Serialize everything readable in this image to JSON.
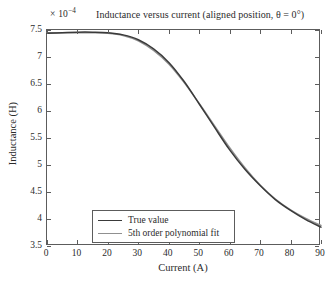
{
  "chart_data": {
    "type": "line",
    "title": "Inductance versus current (aligned position, θ = 0°)",
    "exponent_multiplier": "× 10",
    "exponent_power": "−4",
    "xlabel": "Current (A)",
    "ylabel": "Inductance (H)",
    "xlim": [
      0,
      90
    ],
    "ylim": [
      3.5,
      7.5
    ],
    "xticks": [
      0,
      10,
      20,
      30,
      40,
      50,
      60,
      70,
      80,
      90
    ],
    "yticks": [
      3.5,
      4,
      4.5,
      5,
      5.5,
      6,
      6.5,
      7,
      7.5
    ],
    "xtick_labels": [
      "0",
      "10",
      "20",
      "30",
      "40",
      "50",
      "60",
      "70",
      "80",
      "90"
    ],
    "ytick_labels": [
      "3.5",
      "4",
      "4.5",
      "5",
      "5.5",
      "6",
      "6.5",
      "7",
      "7.5"
    ],
    "grid": false,
    "legend_position": "lower-left-inside",
    "x": [
      0,
      5,
      10,
      15,
      20,
      25,
      30,
      35,
      40,
      45,
      50,
      55,
      60,
      65,
      70,
      75,
      80,
      85,
      90
    ],
    "series": [
      {
        "name": "True value",
        "color": "#3a3a3a",
        "values": [
          7.44,
          7.45,
          7.46,
          7.46,
          7.45,
          7.41,
          7.32,
          7.15,
          6.9,
          6.55,
          6.13,
          5.7,
          5.28,
          4.92,
          4.62,
          4.36,
          4.16,
          3.99,
          3.85
        ]
      },
      {
        "name": "5th order polynomial fit",
        "color": "#909090",
        "values": [
          7.45,
          7.45,
          7.45,
          7.45,
          7.44,
          7.4,
          7.3,
          7.12,
          6.87,
          6.53,
          6.14,
          5.73,
          5.32,
          4.95,
          4.63,
          4.37,
          4.17,
          4.01,
          3.88
        ]
      }
    ]
  },
  "legend": {
    "entries": [
      {
        "label": "True value"
      },
      {
        "label": "5th order polynomial fit"
      }
    ]
  },
  "colors": {
    "true_value": "#3a3a3a",
    "poly_fit": "#909090",
    "axis": "#5c5c5c",
    "text": "#2b2b2b",
    "background": "#ffffff"
  }
}
